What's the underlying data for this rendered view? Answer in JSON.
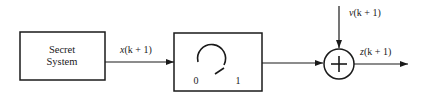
{
  "diagram": {
    "type": "block-diagram",
    "blocks": [
      {
        "id": "secret-system",
        "label_line1": "Secret",
        "label_line2": "System"
      },
      {
        "id": "switch",
        "label_left": "0",
        "label_right": "1"
      },
      {
        "id": "summing-junction",
        "symbol": "+"
      }
    ],
    "signals": {
      "x": {
        "var": "x",
        "arg": "(k + 1)",
        "full": "x(k + 1)"
      },
      "v": {
        "var": "v",
        "arg": "(k + 1)",
        "full": "v(k + 1)"
      },
      "z": {
        "var": "z",
        "arg": "(k + 1)",
        "full": "z(k + 1)"
      }
    },
    "colors": {
      "stroke": "#1a1a1a",
      "background": "#ffffff"
    }
  }
}
